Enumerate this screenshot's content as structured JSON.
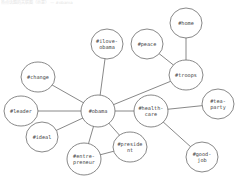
{
  "caption": "热点话题的关联图（示意） — #obama",
  "colors": {
    "edge": "#6a6a6a",
    "node_border": "#6a6a6a",
    "node_fill": "#ffffff",
    "text": "#444444"
  },
  "nodes": [
    {
      "id": "home",
      "lines": [
        "#home"
      ],
      "cx": 186,
      "cy": 23,
      "rx": 16,
      "ry": 15
    },
    {
      "id": "peace",
      "lines": [
        "#peace"
      ],
      "cx": 147,
      "cy": 44,
      "rx": 16,
      "ry": 15
    },
    {
      "id": "ilove-obama",
      "lines": [
        "#ilove-",
        "obama"
      ],
      "cx": 107,
      "cy": 44,
      "rx": 16,
      "ry": 15
    },
    {
      "id": "troops",
      "lines": [
        "#troops"
      ],
      "cx": 186,
      "cy": 75,
      "rx": 17,
      "ry": 15
    },
    {
      "id": "change",
      "lines": [
        "#change"
      ],
      "cx": 38,
      "cy": 77,
      "rx": 17,
      "ry": 15
    },
    {
      "id": "leader",
      "lines": [
        "#leader"
      ],
      "cx": 21,
      "cy": 111,
      "rx": 17,
      "ry": 15
    },
    {
      "id": "obama",
      "lines": [
        "#obama"
      ],
      "cx": 98,
      "cy": 111,
      "rx": 17,
      "ry": 16
    },
    {
      "id": "health-care",
      "lines": [
        "#health-",
        "care"
      ],
      "cx": 151,
      "cy": 111,
      "rx": 17,
      "ry": 16
    },
    {
      "id": "tea-party",
      "lines": [
        "#tea-",
        "party"
      ],
      "cx": 218,
      "cy": 104,
      "rx": 16,
      "ry": 15
    },
    {
      "id": "ideal",
      "lines": [
        "#ideal"
      ],
      "cx": 42,
      "cy": 137,
      "rx": 16,
      "ry": 15
    },
    {
      "id": "president",
      "lines": [
        "#preside",
        "nt"
      ],
      "cx": 130,
      "cy": 147,
      "rx": 17,
      "ry": 15
    },
    {
      "id": "entre-preneur",
      "lines": [
        "#entre-",
        "preneur"
      ],
      "cx": 84,
      "cy": 159,
      "rx": 17,
      "ry": 16
    },
    {
      "id": "good-job",
      "lines": [
        "#good-",
        "job"
      ],
      "cx": 202,
      "cy": 157,
      "rx": 16,
      "ry": 15
    }
  ],
  "edges": [
    [
      "obama",
      "ilove-obama"
    ],
    [
      "obama",
      "change"
    ],
    [
      "obama",
      "leader"
    ],
    [
      "obama",
      "ideal"
    ],
    [
      "obama",
      "entre-preneur"
    ],
    [
      "obama",
      "president"
    ],
    [
      "obama",
      "health-care"
    ],
    [
      "obama",
      "troops"
    ],
    [
      "troops",
      "home"
    ],
    [
      "troops",
      "peace"
    ],
    [
      "health-care",
      "tea-party"
    ],
    [
      "health-care",
      "good-job"
    ],
    [
      "entre-preneur",
      "president"
    ]
  ]
}
